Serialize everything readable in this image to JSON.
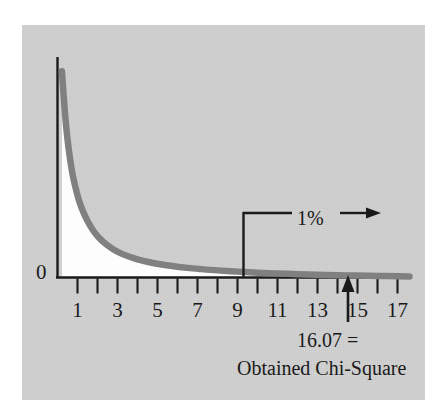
{
  "figure": {
    "background_color": "#ffffff",
    "panel_color": "#cfcfcf",
    "curve_color": "#808080",
    "axis_color": "#1a1a1a"
  },
  "chart_data": {
    "type": "line",
    "title": "",
    "subtitle": "",
    "xlabel": "",
    "ylabel": "",
    "xlim": [
      0,
      17.6
    ],
    "ylim": [
      0,
      1.0
    ],
    "grid": false,
    "legend": null,
    "x_tick_labels": [
      "1",
      "3",
      "5",
      "7",
      "9",
      "11",
      "13",
      "15",
      "17"
    ],
    "x_tick_values": [
      1,
      3,
      5,
      7,
      9,
      11,
      13,
      15,
      17
    ],
    "x_minor_tick_values": [
      1,
      2,
      3,
      4,
      5,
      6,
      7,
      8,
      9,
      10,
      11,
      12,
      13,
      14,
      15,
      16,
      17
    ],
    "y_origin_label": "0",
    "series": [
      {
        "name": "Chi-Square distribution",
        "x": [
          0.22,
          0.3,
          0.4,
          0.5,
          0.6,
          0.75,
          0.9,
          1.1,
          1.3,
          1.5,
          1.8,
          2.1,
          2.4,
          2.8,
          3.2,
          3.6,
          4.0,
          4.6,
          5.2,
          5.8,
          6.5,
          7.2,
          8.0,
          9.0,
          10.0,
          11.0,
          12.0,
          13.0,
          14.0,
          15.0,
          16.0,
          17.0,
          17.6
        ],
        "y": [
          0.985,
          0.88,
          0.755,
          0.66,
          0.585,
          0.495,
          0.43,
          0.36,
          0.31,
          0.27,
          0.222,
          0.187,
          0.161,
          0.134,
          0.114,
          0.099,
          0.087,
          0.073,
          0.062,
          0.054,
          0.046,
          0.04,
          0.034,
          0.028,
          0.023,
          0.019,
          0.016,
          0.013,
          0.011,
          0.009,
          0.007,
          0.006,
          0.005
        ]
      }
    ],
    "annotations": [
      {
        "id": "alpha-region",
        "label": "1%",
        "type": "tail-region-marker",
        "x_boundary": 9.3,
        "description": "vertical boundary line at the 1% critical value with a rightward arrow labeled 1%"
      },
      {
        "id": "obtained-value",
        "label_line1": "16.07 =",
        "label_line2": "Obtained Chi-Square",
        "type": "up-arrow-pointer",
        "x": 16.07,
        "value": 16.07
      }
    ]
  },
  "labels": {
    "zero": "0",
    "percent": "1%",
    "obtained_value": "16.07 =",
    "obtained_caption": "Obtained Chi-Square"
  }
}
